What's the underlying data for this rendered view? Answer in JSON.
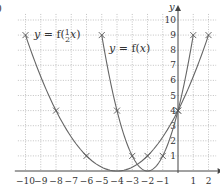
{
  "question_label_fragment": ")",
  "chart_data": {
    "type": "line",
    "title": "",
    "xlabel": "x",
    "ylabel": "y",
    "xlim": [
      -10.5,
      2.6
    ],
    "ylim": [
      0,
      10.6
    ],
    "grid": true,
    "grid_style": "dotted",
    "x_ticks": [
      -10,
      -9,
      -8,
      -7,
      -6,
      -5,
      -4,
      -3,
      -2,
      -1,
      1,
      2
    ],
    "x_tick_labels": [
      "−10",
      "−9",
      "−8",
      "−7",
      "−6",
      "−5",
      "−4",
      "−3",
      "−2",
      "−1",
      "1",
      "2"
    ],
    "y_ticks": [
      1,
      2,
      3,
      4,
      5,
      6,
      7,
      8,
      9,
      10
    ],
    "y_tick_labels": [
      "1",
      "2",
      "3",
      "4",
      "5",
      "6",
      "7",
      "8",
      "9",
      "10"
    ],
    "series": [
      {
        "name": "y = f(x)",
        "label": "y = f(x)",
        "marker": "x",
        "points": [
          [
            -5,
            9
          ],
          [
            -4,
            4
          ],
          [
            -3,
            1
          ],
          [
            -2,
            0
          ],
          [
            -1,
            1
          ],
          [
            0,
            4
          ],
          [
            1,
            9
          ]
        ],
        "marked_points": [
          [
            -5,
            9
          ],
          [
            -4,
            4
          ],
          [
            -3,
            1
          ],
          [
            -1,
            1
          ],
          [
            0,
            4
          ],
          [
            1,
            9
          ]
        ]
      },
      {
        "name": "y = f(1/2 x)",
        "label": "y = f(½ x)",
        "marker": "x",
        "points": [
          [
            -10,
            9
          ],
          [
            -8,
            4
          ],
          [
            -6,
            1
          ],
          [
            -4,
            0
          ],
          [
            -2,
            1
          ],
          [
            0,
            4
          ],
          [
            2,
            9
          ]
        ],
        "marked_points": [
          [
            -10,
            9
          ],
          [
            -8,
            4
          ],
          [
            -6,
            1
          ],
          [
            -2,
            1
          ],
          [
            0,
            4
          ],
          [
            2,
            9
          ]
        ]
      }
    ],
    "annotations": [
      {
        "text": "y = f(½ x)",
        "near": [
          -9.5,
          9
        ]
      },
      {
        "text": "y = f(x)",
        "near": [
          -4.5,
          7.7
        ]
      }
    ]
  },
  "colors": {
    "curve": "#666666",
    "grid": "#9a9a9a",
    "axis": "#444444",
    "text": "#333333"
  }
}
